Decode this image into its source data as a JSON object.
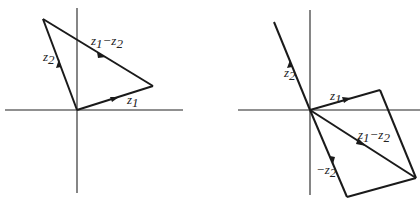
{
  "figure": {
    "left_panel": {
      "labels": {
        "z1": "z",
        "z1_sub": "1",
        "z2": "z",
        "z2_sub": "2",
        "diff_a": "z",
        "diff_a_sub": "1",
        "diff_minus": "−",
        "diff_b": "z",
        "diff_b_sub": "2"
      }
    },
    "right_panel": {
      "labels": {
        "z1": "z",
        "z1_sub": "1",
        "z2": "z",
        "z2_sub": "2",
        "neg_z2_minus": "−",
        "neg_z2": "z",
        "neg_z2_sub": "2",
        "diff_a": "z",
        "diff_a_sub": "1",
        "diff_minus": "−",
        "diff_b": "z",
        "diff_b_sub": "2"
      }
    },
    "colors": {
      "line": "#1a1a1a",
      "axis": "#222222",
      "background": "#ffffff"
    }
  }
}
